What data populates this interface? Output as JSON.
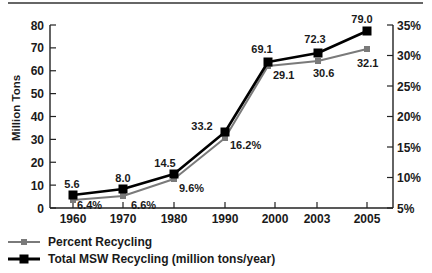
{
  "chart_data": {
    "type": "line",
    "title": "",
    "xlabel": "",
    "ylabel": "Million Tons",
    "y2label": "",
    "categories": [
      "1960",
      "1970",
      "1980",
      "1990",
      "2000",
      "2003",
      "2005"
    ],
    "series": [
      {
        "name": "Percent Recycling",
        "axis": "right",
        "unit": "%",
        "values": [
          6.4,
          6.6,
          9.6,
          16.2,
          29.1,
          30.6,
          32.1
        ],
        "labels": [
          "6.4%",
          "6.6%",
          "9.6%",
          "16.2%",
          "29.1",
          "30.6",
          "32.1"
        ],
        "color": "#7a7a7a",
        "marker": "square-small"
      },
      {
        "name": "Total MSW Recycling (million tons/year)",
        "axis": "left",
        "unit": "million tons/year",
        "values": [
          5.6,
          8.0,
          14.5,
          33.2,
          69.1,
          72.3,
          79.0
        ],
        "labels": [
          "5.6",
          "8.0",
          "14.5",
          "33.2",
          "69.1",
          "72.3",
          "79.0"
        ],
        "color": "#000000",
        "marker": "square-large"
      }
    ],
    "ylim": [
      0,
      80
    ],
    "y_ticks": [
      "0",
      "10",
      "20",
      "30",
      "40",
      "50",
      "60",
      "70",
      "80"
    ],
    "y2lim": [
      5,
      35
    ],
    "y2_ticks": [
      "5%",
      "10%",
      "15%",
      "20%",
      "25%",
      "30%",
      "35%"
    ],
    "grid": false,
    "legend_position": "bottom-left"
  }
}
